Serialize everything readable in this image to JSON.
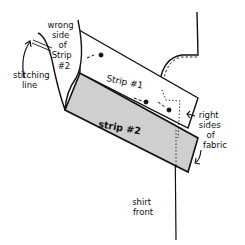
{
  "diagram": {
    "type": "sewing-illustration",
    "colors": {
      "ink": "#111111",
      "strip2_fill": "#cfcfcf",
      "background": "#ffffff"
    },
    "labels": {
      "wrong_side": [
        "wrong",
        "side",
        "of",
        "Strip",
        "#2"
      ],
      "stitching_line": [
        "stitching",
        "line"
      ],
      "strip1": "Strip #1",
      "strip2": "strip #2",
      "right_sides": [
        "right",
        "sides",
        "of",
        "fabric"
      ],
      "shirt_front": [
        "shirt",
        "front"
      ]
    }
  }
}
